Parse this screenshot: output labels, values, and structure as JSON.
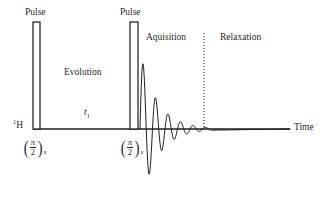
{
  "figure": {
    "kind": "nmr-pulse-sequence-diagram",
    "background_color": "#ffffff",
    "stroke_color": "#1f1f1f",
    "width": 328,
    "height": 207
  },
  "axis": {
    "nucleus_label": "H",
    "nucleus_mass_number": "1",
    "time_label": "Time",
    "baseline_y": 129,
    "baseline_x_start": 33,
    "baseline_x_end": 290
  },
  "pulses": [
    {
      "caption": "Pulse",
      "flip_numerator": "π",
      "flip_denominator": "2",
      "phase": "x",
      "x": 33,
      "width": 7,
      "top_y": 22
    },
    {
      "caption": "Pulse",
      "flip_numerator": "π",
      "flip_denominator": "2",
      "phase": "x",
      "x": 130,
      "width": 8,
      "top_y": 22
    }
  ],
  "periods": [
    {
      "label": "Evolution",
      "x": 64,
      "y": 68
    },
    {
      "label": "Aquisition",
      "x": 146,
      "y": 33
    },
    {
      "label": "Relaxation",
      "x": 220,
      "y": 33
    }
  ],
  "evolution_time": {
    "symbol": "t",
    "subscript": "1",
    "x": 84,
    "y": 108
  },
  "divider": {
    "name": "acquisition-relaxation-divider",
    "style": "dotted",
    "x": 204,
    "y_top": 33,
    "y_bottom": 129
  },
  "chart_data": {
    "type": "line",
    "title": "",
    "xlabel": "Time",
    "ylabel": "",
    "grid": false,
    "legend": false,
    "series": [
      {
        "name": "Free Induction Decay",
        "description": "Exponentially damped oscillation following the second 90-degree pulse",
        "baseline": 129,
        "start_x": 140,
        "end_x": 212,
        "amplitude_initial": 78,
        "decay_constant": 17,
        "period": 12.5,
        "points": [
          [
            140,
            129
          ],
          [
            142,
            120
          ],
          [
            144,
            95
          ],
          [
            146,
            62
          ],
          [
            148,
            52
          ],
          [
            150,
            92
          ],
          [
            152,
            150
          ],
          [
            154,
            188
          ],
          [
            156,
            200
          ],
          [
            158,
            175
          ],
          [
            160,
            126
          ],
          [
            162,
            95
          ],
          [
            164,
            78
          ],
          [
            166,
            88
          ],
          [
            168,
            122
          ],
          [
            170,
            160
          ],
          [
            172,
            178
          ],
          [
            174,
            166
          ],
          [
            176,
            131
          ],
          [
            178,
            104
          ],
          [
            180,
            93
          ],
          [
            182,
            100
          ],
          [
            184,
            124
          ],
          [
            186,
            150
          ],
          [
            188,
            158
          ],
          [
            190,
            147
          ],
          [
            192,
            128
          ],
          [
            194,
            112
          ],
          [
            196,
            107
          ],
          [
            198,
            112
          ],
          [
            200,
            126
          ],
          [
            202,
            138
          ],
          [
            204,
            140
          ],
          [
            206,
            134
          ],
          [
            208,
            129
          ],
          [
            210,
            125
          ],
          [
            212,
            128
          ],
          [
            214,
            129
          ],
          [
            216,
            129
          ]
        ]
      }
    ]
  }
}
